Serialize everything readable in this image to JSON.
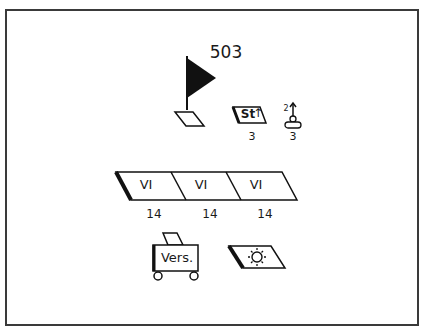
{
  "diagram": {
    "unit_number": "503",
    "staff_symbol": {
      "text": "St",
      "count": "3"
    },
    "signal_symbol": {
      "superscript": "2",
      "count": "3"
    },
    "battalions": [
      {
        "label": "VI",
        "count": "14"
      },
      {
        "label": "VI",
        "count": "14"
      },
      {
        "label": "VI",
        "count": "14"
      }
    ],
    "supply": {
      "label": "Vers."
    },
    "icons": {
      "flag": "flag-icon",
      "flag_base": "parallelogram-icon",
      "staff": "staff-arrow-icon",
      "signal": "antenna-person-icon",
      "supply_cart": "cart-icon",
      "light": "sun-icon"
    },
    "colors": {
      "ink": "#111111",
      "frame": "#3a3a3a",
      "background": "#ffffff"
    }
  }
}
